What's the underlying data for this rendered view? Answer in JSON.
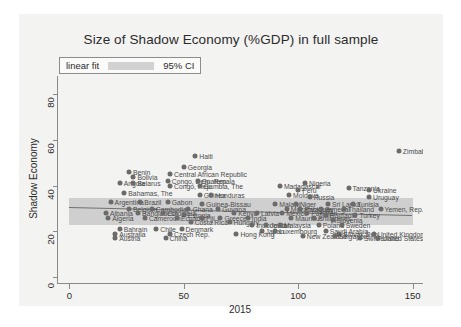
{
  "chart_data": {
    "type": "scatter",
    "title": "Size of Shadow Economy (%GDP) in full sample",
    "xlabel": "2015",
    "ylabel": "Shadow Economy",
    "xlim": [
      -5,
      155
    ],
    "ylim": [
      -3,
      88
    ],
    "xticks": [
      0,
      50,
      100,
      150
    ],
    "yticks": [
      0,
      20,
      40,
      60,
      80
    ],
    "grid": false,
    "legend": {
      "position": "top-left",
      "entries": [
        {
          "label": "linear fit",
          "kind": "line"
        },
        {
          "label": "95% CI",
          "kind": "band"
        }
      ]
    },
    "fit": {
      "x0": 0,
      "y0": 30.5,
      "x1": 150,
      "y1": 27.0,
      "ci_half_width_left": 3.4,
      "ci_half_width_right": 4.2
    },
    "points": [
      {
        "label": "Zimbabwe",
        "x": 144,
        "y": 55
      },
      {
        "label": "Haiti",
        "x": 55,
        "y": 53
      },
      {
        "label": "Georgia",
        "x": 50,
        "y": 48
      },
      {
        "label": "Benin",
        "x": 26,
        "y": 46
      },
      {
        "label": "Bolivia",
        "x": 28,
        "y": 44
      },
      {
        "label": "Central African Republic",
        "x": 44,
        "y": 45
      },
      {
        "label": "Congo, Dem. Rep.",
        "x": 43,
        "y": 42
      },
      {
        "label": "Guatemala",
        "x": 56,
        "y": 42
      },
      {
        "label": "Angola",
        "x": 22,
        "y": 41
      },
      {
        "label": "Belarus",
        "x": 28,
        "y": 41
      },
      {
        "label": "Congo, Rep.",
        "x": 44,
        "y": 40
      },
      {
        "label": "Gambia, The",
        "x": 57,
        "y": 40
      },
      {
        "label": "Madagascar",
        "x": 92,
        "y": 40
      },
      {
        "label": "Nigeria",
        "x": 103,
        "y": 41
      },
      {
        "label": "Peru",
        "x": 100,
        "y": 38
      },
      {
        "label": "Tanzania",
        "x": 122,
        "y": 39
      },
      {
        "label": "Ukraine",
        "x": 131,
        "y": 38
      },
      {
        "label": "Bahamas, The",
        "x": 24,
        "y": 37
      },
      {
        "label": "Guinea",
        "x": 57,
        "y": 36
      },
      {
        "label": "Honduras",
        "x": 62,
        "y": 36
      },
      {
        "label": "Moldova",
        "x": 96,
        "y": 36
      },
      {
        "label": "Russia",
        "x": 105,
        "y": 35
      },
      {
        "label": "Uruguay",
        "x": 131,
        "y": 35
      },
      {
        "label": "Argentina",
        "x": 18,
        "y": 33
      },
      {
        "label": "Brazil",
        "x": 31,
        "y": 33
      },
      {
        "label": "Gabon",
        "x": 43,
        "y": 33
      },
      {
        "label": "Guinea-Bissau",
        "x": 58,
        "y": 32
      },
      {
        "label": "Malawi",
        "x": 90,
        "y": 32
      },
      {
        "label": "Niger",
        "x": 99,
        "y": 32
      },
      {
        "label": "Sri Lanka",
        "x": 113,
        "y": 32
      },
      {
        "label": "Tunisia",
        "x": 124,
        "y": 32
      },
      {
        "label": "Belgium",
        "x": 26,
        "y": 30
      },
      {
        "label": "Cambodia",
        "x": 36,
        "y": 30
      },
      {
        "label": "Ghana",
        "x": 52,
        "y": 30
      },
      {
        "label": "Guyana",
        "x": 65,
        "y": 30
      },
      {
        "label": "Mozambique",
        "x": 95,
        "y": 30
      },
      {
        "label": "Paraguay",
        "x": 101,
        "y": 30
      },
      {
        "label": "Senegal",
        "x": 110,
        "y": 30
      },
      {
        "label": "Thailand",
        "x": 120,
        "y": 30
      },
      {
        "label": "Yemen, Rep.",
        "x": 136,
        "y": 30
      },
      {
        "label": "Albania",
        "x": 16,
        "y": 28
      },
      {
        "label": "Bangladesh",
        "x": 30,
        "y": 28
      },
      {
        "label": "Colombia",
        "x": 41,
        "y": 28
      },
      {
        "label": "Estonia",
        "x": 50,
        "y": 27
      },
      {
        "label": "Kenya",
        "x": 72,
        "y": 28
      },
      {
        "label": "Latvia",
        "x": 82,
        "y": 28
      },
      {
        "label": "Mexico",
        "x": 93,
        "y": 28
      },
      {
        "label": "Pakistan",
        "x": 104,
        "y": 28
      },
      {
        "label": "Romania",
        "x": 112,
        "y": 27
      },
      {
        "label": "Turkey",
        "x": 125,
        "y": 27
      },
      {
        "label": "Algeria",
        "x": 17,
        "y": 26
      },
      {
        "label": "Cameroon",
        "x": 33,
        "y": 26
      },
      {
        "label": "Ecuador",
        "x": 47,
        "y": 26
      },
      {
        "label": "Fiji",
        "x": 58,
        "y": 26
      },
      {
        "label": "Greece",
        "x": 66,
        "y": 26
      },
      {
        "label": "India",
        "x": 78,
        "y": 26
      },
      {
        "label": "Mauritius",
        "x": 97,
        "y": 26
      },
      {
        "label": "Philippines",
        "x": 107,
        "y": 26
      },
      {
        "label": "Slovenia",
        "x": 115,
        "y": 25
      },
      {
        "label": "Costa Rica",
        "x": 53,
        "y": 24
      },
      {
        "label": "Hungary",
        "x": 70,
        "y": 24
      },
      {
        "label": "Indonesia",
        "x": 80,
        "y": 23
      },
      {
        "label": "Jordan",
        "x": 86,
        "y": 23
      },
      {
        "label": "Malaysia",
        "x": 92,
        "y": 23
      },
      {
        "label": "Poland",
        "x": 109,
        "y": 23
      },
      {
        "label": "Sweden",
        "x": 119,
        "y": 23
      },
      {
        "label": "Bahrain",
        "x": 22,
        "y": 21
      },
      {
        "label": "Chile",
        "x": 38,
        "y": 21
      },
      {
        "label": "Denmark",
        "x": 49,
        "y": 21
      },
      {
        "label": "Japan",
        "x": 84,
        "y": 20
      },
      {
        "label": "Luxembourg",
        "x": 90,
        "y": 20
      },
      {
        "label": "Saudi Arabia",
        "x": 112,
        "y": 20
      },
      {
        "label": "Slovak Rep.",
        "x": 118,
        "y": 19
      },
      {
        "label": "United Kingdom",
        "x": 133,
        "y": 19
      },
      {
        "label": "Australia",
        "x": 20,
        "y": 19
      },
      {
        "label": "Czech Rep.",
        "x": 44,
        "y": 19
      },
      {
        "label": "Hong Kong",
        "x": 73,
        "y": 19
      },
      {
        "label": "New Zealand",
        "x": 102,
        "y": 18
      },
      {
        "label": "Singapore",
        "x": 116,
        "y": 18
      },
      {
        "label": "Switzerland",
        "x": 127,
        "y": 17
      },
      {
        "label": "United States",
        "x": 135,
        "y": 17
      },
      {
        "label": "Austria",
        "x": 20,
        "y": 17
      },
      {
        "label": "China",
        "x": 42,
        "y": 17
      }
    ]
  }
}
